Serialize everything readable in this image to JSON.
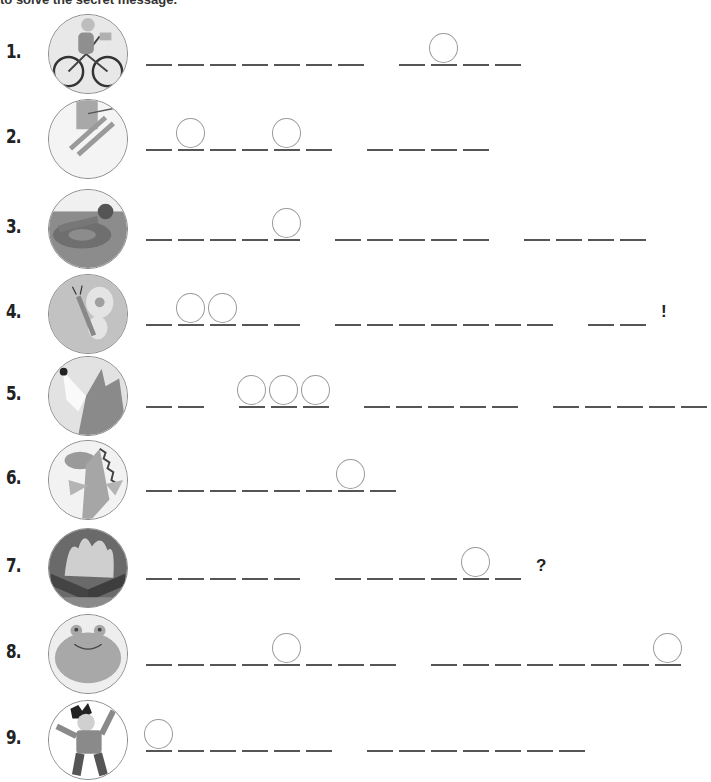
{
  "header": {
    "text": "to solve the secret message."
  },
  "rows": [
    {
      "number": "1.",
      "picture": "girl-riding-bicycle",
      "words": [
        {
          "blanks": 7,
          "circles": []
        },
        {
          "blanks": 4,
          "circles": [
            1
          ]
        }
      ],
      "punctuation": ""
    },
    {
      "number": "2.",
      "picture": "person-skiing",
      "words": [
        {
          "blanks": 6,
          "circles": [
            1,
            4
          ]
        },
        {
          "blanks": 4,
          "circles": []
        }
      ],
      "punctuation": ""
    },
    {
      "number": "3.",
      "picture": "boy-floating-on-inner-tube",
      "words": [
        {
          "blanks": 5,
          "circles": [
            4
          ]
        },
        {
          "blanks": 5,
          "circles": []
        },
        {
          "blanks": 4,
          "circles": []
        }
      ],
      "punctuation": ""
    },
    {
      "number": "4.",
      "picture": "butterfly",
      "words": [
        {
          "blanks": 5,
          "circles": [
            1,
            2
          ]
        },
        {
          "blanks": 7,
          "circles": []
        },
        {
          "blanks": 2,
          "circles": []
        }
      ],
      "punctuation": "!"
    },
    {
      "number": "5.",
      "picture": "wolf-howling",
      "words": [
        {
          "blanks": 2,
          "circles": []
        },
        {
          "blanks": 3,
          "circles": [
            0,
            1,
            2
          ]
        },
        {
          "blanks": 5,
          "circles": []
        },
        {
          "blanks": 5,
          "circles": []
        }
      ],
      "punctuation": ""
    },
    {
      "number": "6.",
      "picture": "dragon",
      "words": [
        {
          "blanks": 8,
          "circles": [
            6
          ]
        }
      ],
      "punctuation": ""
    },
    {
      "number": "7.",
      "picture": "campfire",
      "words": [
        {
          "blanks": 5,
          "circles": []
        },
        {
          "blanks": 6,
          "circles": [
            4
          ]
        }
      ],
      "punctuation": "?"
    },
    {
      "number": "8.",
      "picture": "frog",
      "words": [
        {
          "blanks": 8,
          "circles": [
            4
          ]
        },
        {
          "blanks": 8,
          "circles": [
            7
          ]
        }
      ],
      "punctuation": ""
    },
    {
      "number": "9.",
      "picture": "boy-jumping-happily",
      "words": [
        {
          "blanks": 6,
          "circles": [
            0
          ]
        },
        {
          "blanks": 7,
          "circles": []
        }
      ],
      "punctuation": ""
    }
  ],
  "layout": {
    "row_tops": [
      4,
      95,
      183,
      268,
      350,
      436,
      520,
      606,
      694
    ],
    "line_offsets": [
      62,
      56,
      58,
      58,
      58,
      56,
      60,
      60,
      58
    ]
  }
}
